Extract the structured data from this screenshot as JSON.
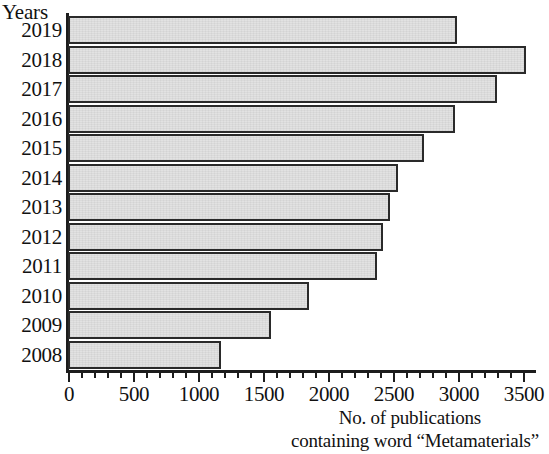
{
  "chart_data": {
    "type": "bar",
    "orientation": "horizontal",
    "title": "",
    "ylabel": "Years",
    "xlabel_lines": [
      "No. of publications",
      "containing word “Metamaterials”"
    ],
    "categories": [
      "2019",
      "2018",
      "2017",
      "2016",
      "2015",
      "2014",
      "2013",
      "2012",
      "2011",
      "2010",
      "2009",
      "2008"
    ],
    "values": [
      2990,
      3520,
      3300,
      2980,
      2740,
      2540,
      2480,
      2420,
      2380,
      1850,
      1560,
      1180
    ],
    "xlim": [
      0,
      3600
    ],
    "xticks": [
      0,
      500,
      1000,
      1500,
      2000,
      2500,
      3000,
      3500
    ],
    "xtick_labels": [
      "0",
      "500",
      "1000",
      "1500",
      "2000",
      "2500",
      "3000",
      "3500"
    ],
    "minor_tick_step": 100,
    "grid": false,
    "legend": null,
    "bar_fill_color": "#e2e2e2",
    "bar_edge_color": "#2a2a2a",
    "axis_color": "#1c1c1c"
  }
}
